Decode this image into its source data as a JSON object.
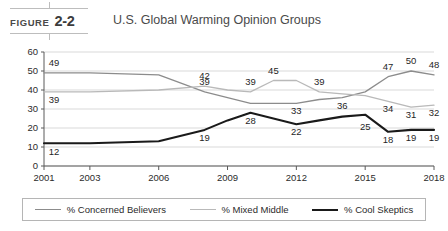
{
  "figure": {
    "word": "FIGURE",
    "number": "2-2",
    "title": "U.S. Global Warming Opinion Groups"
  },
  "legend": {
    "position": "bottom",
    "items": [
      {
        "label": "% Concerned Believers",
        "color": "#8c8c8c",
        "width": 1.4
      },
      {
        "label": "% Mixed Middle",
        "color": "#b9b9b9",
        "width": 1.4
      },
      {
        "label": "% Cool Skeptics",
        "color": "#1a1a1a",
        "width": 2.2
      }
    ]
  },
  "chart_data": {
    "type": "line",
    "title": "U.S. Global Warming Opinion Groups",
    "xlabel": "",
    "ylabel": "",
    "xlim": [
      2001,
      2018
    ],
    "ylim": [
      0,
      60
    ],
    "yticks": [
      0,
      10,
      20,
      30,
      40,
      50,
      60
    ],
    "xticks": [
      2001,
      2003,
      2006,
      2009,
      2012,
      2015,
      2018
    ],
    "grid": true,
    "x": [
      2001,
      2003,
      2006,
      2008,
      2009,
      2010,
      2011,
      2012,
      2013,
      2014,
      2015,
      2016,
      2017,
      2018
    ],
    "series": [
      {
        "name": "% Concerned Believers",
        "color": "#8c8c8c",
        "values": [
          49,
          49,
          48,
          39,
          36,
          33,
          33,
          33,
          35,
          36,
          39,
          47,
          50,
          48
        ],
        "labels": [
          {
            "x": 2001,
            "value": 49,
            "text": "49"
          },
          {
            "x": 2008,
            "value": 39,
            "text": "39"
          },
          {
            "x": 2012,
            "value": 33,
            "text": "33"
          },
          {
            "x": 2014,
            "value": 36,
            "text": "36"
          },
          {
            "x": 2016,
            "value": 47,
            "text": "47"
          },
          {
            "x": 2017,
            "value": 50,
            "text": "50"
          },
          {
            "x": 2018,
            "value": 48,
            "text": "48"
          }
        ]
      },
      {
        "name": "% Mixed Middle",
        "color": "#b9b9b9",
        "values": [
          39,
          39,
          40,
          42,
          40,
          39,
          45,
          45,
          39,
          38,
          37,
          34,
          31,
          32
        ],
        "labels": [
          {
            "x": 2001,
            "value": 39,
            "text": "39"
          },
          {
            "x": 2008,
            "value": 42,
            "text": "42"
          },
          {
            "x": 2010,
            "value": 39,
            "text": "39"
          },
          {
            "x": 2011,
            "value": 45,
            "text": "45"
          },
          {
            "x": 2013,
            "value": 39,
            "text": "39"
          },
          {
            "x": 2016,
            "value": 34,
            "text": "34"
          },
          {
            "x": 2017,
            "value": 31,
            "text": "31"
          },
          {
            "x": 2018,
            "value": 32,
            "text": "32"
          }
        ]
      },
      {
        "name": "% Cool Skeptics",
        "color": "#1a1a1a",
        "values": [
          12,
          12,
          13,
          19,
          24,
          28,
          25,
          22,
          24,
          26,
          27,
          18,
          19,
          19
        ],
        "labels": [
          {
            "x": 2001,
            "value": 12,
            "text": "12"
          },
          {
            "x": 2008,
            "value": 19,
            "text": "19"
          },
          {
            "x": 2010,
            "value": 28,
            "text": "28"
          },
          {
            "x": 2012,
            "value": 22,
            "text": "22"
          },
          {
            "x": 2015,
            "value": 25,
            "text": "25"
          },
          {
            "x": 2016,
            "value": 18,
            "text": "18"
          },
          {
            "x": 2017,
            "value": 19,
            "text": "19"
          },
          {
            "x": 2018,
            "value": 19,
            "text": "19"
          }
        ]
      }
    ]
  }
}
